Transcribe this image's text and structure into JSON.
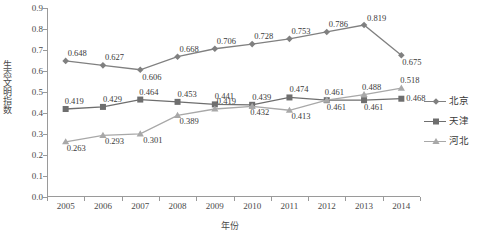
{
  "chart_data": {
    "type": "line",
    "title": "",
    "xlabel": "年份",
    "ylabel": "生态文明指数",
    "categories": [
      "2005",
      "2006",
      "2007",
      "2008",
      "2009",
      "2010",
      "2011",
      "2012",
      "2013",
      "2014"
    ],
    "x": [
      2005,
      2006,
      2007,
      2008,
      2009,
      2010,
      2011,
      2012,
      2013,
      2014
    ],
    "ylim": [
      0.0,
      0.9
    ],
    "ytick_labels": [
      "0.0",
      "0.1",
      "0.2",
      "0.3",
      "0.4",
      "0.5",
      "0.6",
      "0.7",
      "0.8",
      "0.9"
    ],
    "ytick_values": [
      0.0,
      0.1,
      0.2,
      0.3,
      0.4,
      0.5,
      0.6,
      0.7,
      0.8,
      0.9
    ],
    "grid": false,
    "legend_position": "right",
    "series": [
      {
        "name": "北京",
        "marker": "diamond",
        "color": "#808080",
        "values": [
          0.648,
          0.627,
          0.606,
          0.668,
          0.706,
          0.728,
          0.753,
          0.786,
          0.819,
          0.675
        ],
        "data_labels": [
          "0.648",
          "0.627",
          "0.606",
          "0.668",
          "0.706",
          "0.728",
          "0.753",
          "0.786",
          "0.819",
          "0.675"
        ]
      },
      {
        "name": "天津",
        "marker": "square",
        "color": "#6e6e6e",
        "values": [
          0.419,
          0.429,
          0.464,
          0.453,
          0.441,
          0.439,
          0.474,
          0.461,
          0.461,
          0.468
        ],
        "data_labels": [
          "0.419",
          "0.429",
          "0.464",
          "0.453",
          "0.441",
          "0.439",
          "0.474",
          "0.461",
          "0.461",
          "0.468"
        ]
      },
      {
        "name": "河北",
        "marker": "triangle",
        "color": "#a8a8a8",
        "values": [
          0.263,
          0.293,
          0.301,
          0.389,
          0.419,
          0.432,
          0.413,
          0.461,
          0.488,
          0.518
        ],
        "data_labels": [
          "0.263",
          "0.293",
          "0.301",
          "0.389",
          "0.419",
          "0.432",
          "0.413",
          "0.461",
          "0.488",
          "0.518"
        ]
      }
    ]
  },
  "legend": {
    "items": [
      {
        "label": "北京"
      },
      {
        "label": "天津"
      },
      {
        "label": "河北"
      }
    ]
  },
  "axes": {
    "y_title": "生态文明指数",
    "x_title": "年份"
  }
}
